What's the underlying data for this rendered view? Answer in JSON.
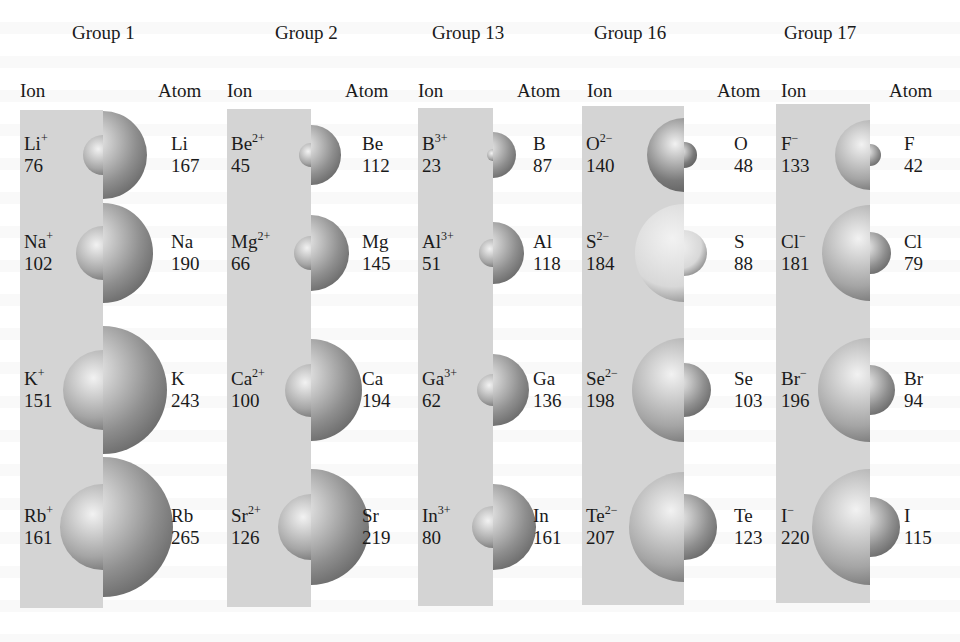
{
  "figure": {
    "column_headers": {
      "ion": "Ion",
      "atom": "Atom"
    },
    "groups": [
      {
        "title": "Group 1",
        "rows": [
          {
            "ion_symbol": "Li",
            "ion_charge": "+",
            "ion_radius": "76",
            "atom_symbol": "Li",
            "atom_radius": "167"
          },
          {
            "ion_symbol": "Na",
            "ion_charge": "+",
            "ion_radius": "102",
            "atom_symbol": "Na",
            "atom_radius": "190"
          },
          {
            "ion_symbol": "K",
            "ion_charge": "+",
            "ion_radius": "151",
            "atom_symbol": "K",
            "atom_radius": "243"
          },
          {
            "ion_symbol": "Rb",
            "ion_charge": "+",
            "ion_radius": "161",
            "atom_symbol": "Rb",
            "atom_radius": "265"
          }
        ]
      },
      {
        "title": "Group 2",
        "rows": [
          {
            "ion_symbol": "Be",
            "ion_charge": "2+",
            "ion_radius": "45",
            "atom_symbol": "Be",
            "atom_radius": "112"
          },
          {
            "ion_symbol": "Mg",
            "ion_charge": "2+",
            "ion_radius": "66",
            "atom_symbol": "Mg",
            "atom_radius": "145"
          },
          {
            "ion_symbol": "Ca",
            "ion_charge": "2+",
            "ion_radius": "100",
            "atom_symbol": "Ca",
            "atom_radius": "194"
          },
          {
            "ion_symbol": "Sr",
            "ion_charge": "2+",
            "ion_radius": "126",
            "atom_symbol": "Sr",
            "atom_radius": "219"
          }
        ]
      },
      {
        "title": "Group 13",
        "rows": [
          {
            "ion_symbol": "B",
            "ion_charge": "3+",
            "ion_radius": "23",
            "atom_symbol": "B",
            "atom_radius": "87"
          },
          {
            "ion_symbol": "Al",
            "ion_charge": "3+",
            "ion_radius": "51",
            "atom_symbol": "Al",
            "atom_radius": "118"
          },
          {
            "ion_symbol": "Ga",
            "ion_charge": "3+",
            "ion_radius": "62",
            "atom_symbol": "Ga",
            "atom_radius": "136"
          },
          {
            "ion_symbol": "In",
            "ion_charge": "3+",
            "ion_radius": "80",
            "atom_symbol": "In",
            "atom_radius": "161"
          }
        ]
      },
      {
        "title": "Group 16",
        "rows": [
          {
            "ion_symbol": "O",
            "ion_charge": "2−",
            "ion_radius": "140",
            "atom_symbol": "O",
            "atom_radius": "48"
          },
          {
            "ion_symbol": "S",
            "ion_charge": "2−",
            "ion_radius": "184",
            "atom_symbol": "S",
            "atom_radius": "88"
          },
          {
            "ion_symbol": "Se",
            "ion_charge": "2−",
            "ion_radius": "198",
            "atom_symbol": "Se",
            "atom_radius": "103"
          },
          {
            "ion_symbol": "Te",
            "ion_charge": "2−",
            "ion_radius": "207",
            "atom_symbol": "Te",
            "atom_radius": "123"
          }
        ]
      },
      {
        "title": "Group 17",
        "rows": [
          {
            "ion_symbol": "F",
            "ion_charge": "−",
            "ion_radius": "133",
            "atom_symbol": "F",
            "atom_radius": "42"
          },
          {
            "ion_symbol": "Cl",
            "ion_charge": "−",
            "ion_radius": "181",
            "atom_symbol": "Cl",
            "atom_radius": "79"
          },
          {
            "ion_symbol": "Br",
            "ion_charge": "−",
            "ion_radius": "196",
            "atom_symbol": "Br",
            "atom_radius": "94"
          },
          {
            "ion_symbol": "I",
            "ion_charge": "−",
            "ion_radius": "220",
            "atom_symbol": "I",
            "atom_radius": "115"
          }
        ]
      }
    ],
    "colors": {
      "panel": "#d4d4d4",
      "sphere_default": "#9a9a9a",
      "sphere_oxygen": "#7a7a7a",
      "sphere_sulfur": "#d8d8d8",
      "text": "#1a1a1a"
    }
  }
}
